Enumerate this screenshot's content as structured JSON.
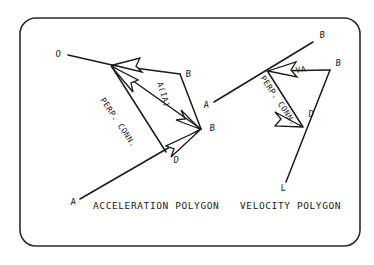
{
  "figure": {
    "title_hidden": "",
    "background_color": "#ffffff",
    "ink_color": "#1a1a1a",
    "frame": {
      "name": "rounded-border",
      "x": 20,
      "y": 18,
      "width": 340,
      "height": 228,
      "corner_radius": 16
    },
    "captions": [
      {
        "id": "acceleration",
        "text": "ACCELERATION POLYGON",
        "x": 93,
        "y": 208
      },
      {
        "id": "velocity",
        "text": "VELOCITY POLYGON",
        "x": 240,
        "y": 208
      }
    ],
    "acceleration_polygon": {
      "name": "acceleration-polygon",
      "point_labels": [
        {
          "id": "accel-O",
          "text": "O",
          "x": 56,
          "y": 57,
          "rotate": -8
        },
        {
          "id": "accel-B-top",
          "text": "B",
          "x": 186,
          "y": 77,
          "rotate": -8
        },
        {
          "id": "accel-B-right",
          "text": "B",
          "x": 213,
          "y": 130,
          "rotate": -8
        },
        {
          "id": "accel-D",
          "text": "D",
          "x": 175,
          "y": 161,
          "rotate": -8
        },
        {
          "id": "accel-A",
          "text": "A",
          "x": 74,
          "y": 204,
          "rotate": -8
        }
      ],
      "vector_labels": [
        {
          "id": "accel-perp-conn",
          "text": "PERP. CONN.",
          "x": 100,
          "y": 100,
          "rotate": 56
        },
        {
          "id": "accel-a-ia",
          "text": "A(IA)",
          "x": 157,
          "y": 83,
          "rotate": 72
        }
      ],
      "vertices": {
        "O": {
          "x": 68,
          "y": 55
        },
        "hub": {
          "x": 110,
          "y": 64
        },
        "B_top": {
          "x": 180,
          "y": 74
        },
        "B_right": {
          "x": 200,
          "y": 128
        },
        "D": {
          "x": 166,
          "y": 152
        },
        "A": {
          "x": 80,
          "y": 199
        }
      }
    },
    "velocity_polygon": {
      "name": "velocity-polygon",
      "point_labels": [
        {
          "id": "vel-B-top",
          "text": "B",
          "x": 322,
          "y": 37,
          "rotate": -8
        },
        {
          "id": "vel-B-right",
          "text": "B",
          "x": 337,
          "y": 65,
          "rotate": -8
        },
        {
          "id": "vel-A",
          "text": "A",
          "x": 205,
          "y": 106,
          "rotate": -8
        },
        {
          "id": "vel-D",
          "text": "D",
          "x": 310,
          "y": 115,
          "rotate": -8
        },
        {
          "id": "vel-L",
          "text": "L",
          "x": 283,
          "y": 189,
          "rotate": -8
        }
      ],
      "vector_labels": [
        {
          "id": "vel-perp-conn",
          "text": "PERP. CONN.",
          "x": 260,
          "y": 78,
          "rotate": 56
        },
        {
          "id": "vel-va",
          "text": "VA",
          "x": 297,
          "y": 72,
          "rotate": -8
        }
      ],
      "vertices": {
        "B_top": {
          "x": 313,
          "y": 42
        },
        "hub": {
          "x": 267,
          "y": 70
        },
        "A": {
          "x": 214,
          "y": 102
        },
        "B_right": {
          "x": 330,
          "y": 70
        },
        "D": {
          "x": 303,
          "y": 126
        },
        "L": {
          "x": 286,
          "y": 182
        }
      }
    }
  }
}
